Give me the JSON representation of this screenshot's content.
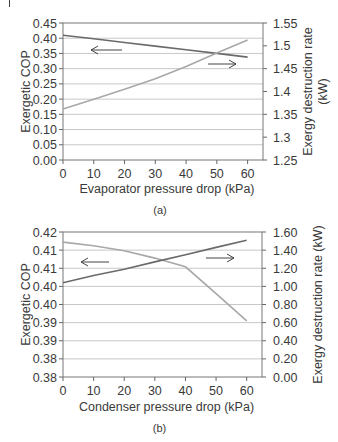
{
  "chart_data": [
    {
      "id": "a",
      "type": "line",
      "caption": "(a)",
      "xlabel": "Evaporator pressure drop (kPa)",
      "ylabel": "Exergetic COP",
      "ylabel_right": "Exergy destruction rate (kW)",
      "xlim": [
        0,
        65
      ],
      "ylim": [
        0.0,
        0.45
      ],
      "ylim_right": [
        1.25,
        1.55
      ],
      "xticks": [
        "0",
        "10",
        "20",
        "30",
        "40",
        "50",
        "60"
      ],
      "yticks": [
        "0.00",
        "0.05",
        "0.10",
        "0.15",
        "0.20",
        "0.25",
        "0.30",
        "0.35",
        "0.40",
        "0.45"
      ],
      "yticks_right": [
        "1.25",
        "1.3",
        "1.35",
        "1.4",
        "1.45",
        "1.5",
        "1.55"
      ],
      "grid": true,
      "x": [
        0,
        10,
        20,
        30,
        40,
        50,
        60
      ],
      "series": [
        {
          "name": "Exergetic COP",
          "axis": "left",
          "color": "#6a6a6a",
          "arrow": "left",
          "values": [
            0.41,
            0.398,
            0.386,
            0.374,
            0.362,
            0.35,
            0.338
          ]
        },
        {
          "name": "Exergy destruction rate",
          "axis": "right",
          "color": "#a8a8a8",
          "arrow": "right",
          "values": [
            1.362,
            1.383,
            1.405,
            1.428,
            1.455,
            1.484,
            1.513
          ]
        }
      ]
    },
    {
      "id": "b",
      "type": "line",
      "caption": "(b)",
      "xlabel": "Condenser pressure drop (kPa)",
      "ylabel": "Exergetic COP",
      "ylabel_right": "Exergy destruction rate (kW)",
      "xlim": [
        0,
        65
      ],
      "ylim": [
        0.38,
        0.42
      ],
      "ylim_right": [
        0.0,
        1.6
      ],
      "xticks": [
        "0",
        "10",
        "20",
        "30",
        "40",
        "50",
        "60"
      ],
      "yticks": [
        "0.38",
        "0.38",
        "0.39",
        "0.39",
        "0.40",
        "0.40",
        "0.41",
        "0.41",
        "0.42"
      ],
      "yticks_right": [
        "0.00",
        "0.20",
        "0.40",
        "0.60",
        "0.80",
        "1.00",
        "1.20",
        "1.40",
        "1.60"
      ],
      "grid": true,
      "x": [
        0,
        10,
        20,
        30,
        40,
        50,
        60
      ],
      "series": [
        {
          "name": "Exergetic COP",
          "axis": "left",
          "color": "#a8a8a8",
          "arrow": "left",
          "values": [
            0.4172,
            0.4162,
            0.4148,
            0.4128,
            0.4104,
            0.403,
            0.3955
          ]
        },
        {
          "name": "Exergy destruction rate",
          "axis": "right",
          "color": "#6a6a6a",
          "arrow": "right",
          "values": [
            1.04,
            1.12,
            1.19,
            1.27,
            1.35,
            1.43,
            1.51
          ]
        }
      ]
    }
  ]
}
